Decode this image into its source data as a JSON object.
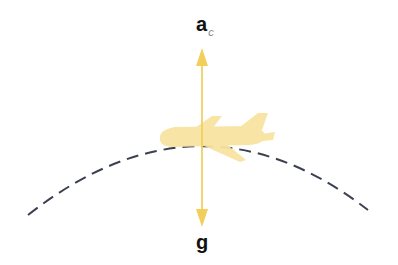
{
  "diagram": {
    "title": "",
    "labels": {
      "centripetal_acceleration": {
        "main": "a",
        "subscript": "c"
      },
      "gravity": {
        "main": "g"
      }
    },
    "elements": [
      {
        "id": "arc",
        "type": "dashed-curve",
        "description": "circular path (Earth's curvature / flight arc)"
      },
      {
        "id": "airplane",
        "type": "shape",
        "description": "airplane silhouette moving along arc"
      },
      {
        "id": "arrow-ac",
        "type": "arrow",
        "direction": "up",
        "label": "a_c"
      },
      {
        "id": "arrow-g",
        "type": "arrow",
        "direction": "down",
        "label": "g"
      }
    ],
    "colors": {
      "airplane": "#f8e3a0",
      "arrow": "#f2cf5a",
      "dashed_line": "#3c4150",
      "label": "#111111",
      "subscript": "#888888"
    }
  }
}
